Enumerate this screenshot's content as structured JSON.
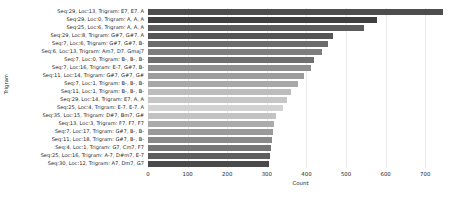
{
  "chart_data": {
    "type": "bar",
    "orientation": "horizontal",
    "title": "",
    "xlabel": "Count",
    "ylabel": "Trigram",
    "xlim": [
      0,
      770
    ],
    "xticks": [
      0,
      100,
      200,
      300,
      400,
      500,
      600,
      700
    ],
    "grid": true,
    "legend": null,
    "categories": [
      "Seq:29, Loc:13, Trigram: E7, E7, A",
      "Seq:29, Loc:0, Trigram: A, A, A",
      "Seq:25, Loc:6, Trigram: A, A, A",
      "Seq:29, Loc:8, Trigram: G#7, G#7, A",
      "Seq:7, Loc:6, Trigram: G#7, G#7, B-",
      "Seq:6, Loc:13, Trigram: Am7, D7, Gmaj7",
      "Seq:7, Loc:0, Trigram: B-, B-, B-",
      "Seq:7, Loc:16, Trigram: E-7, G#7, B-",
      "Seq:11, Loc:14, Trigram: G#7, G#7, G#",
      "Seq:7, Loc:1, Trigram: B-, B-, B-",
      "Seq:11, Loc:1, Trigram: B-, B-, B-",
      "Seq:29, Loc:14, Trigram: E7, A, A",
      "Seq:25, Loc:4, Trigram: E-7, E-7, A",
      "Seq:35, Loc:15, Trigram: D#7, Bm7, G#",
      "Seq:13, Loc:3, Trigram: F7, F7, F7",
      "Seq:7, Loc:17, Trigram: G#7, B-, B-",
      "Seq:11, Loc:18, Trigram: G#7, B-, B-",
      "Seq:4, Loc:1, Trigram: G7, Cm7, F7",
      "Seq:25, Loc:16, Trigram: A-7, D#m7, E-7",
      "Seq:30, Loc:12, Trigram: A7, Dm7, G7"
    ],
    "values": [
      745,
      578,
      545,
      468,
      455,
      440,
      420,
      412,
      395,
      378,
      360,
      352,
      340,
      322,
      318,
      315,
      312,
      310,
      308,
      305
    ],
    "bar_colors": [
      "#4d4d4d",
      "#3f3f3f",
      "#5c5c5c",
      "#555555",
      "#6b6b6b",
      "#7d7d7d",
      "#6f6f6f",
      "#8f8f8f",
      "#9c9c9c",
      "#a8a8a8",
      "#bcbcbc",
      "#c6c6c6",
      "#d2d2d2",
      "#c2c2c2",
      "#ababab",
      "#9a9a9a",
      "#8a8a8a",
      "#767676",
      "#5e5e5e",
      "#4a4a4a"
    ]
  }
}
